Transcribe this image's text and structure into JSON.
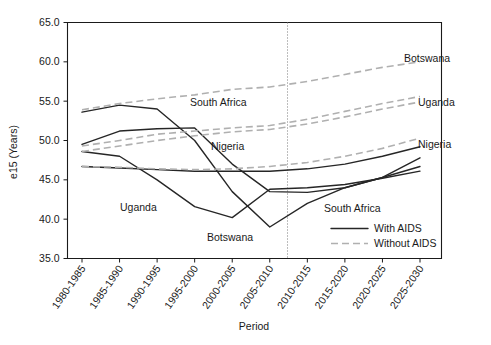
{
  "chart_data": {
    "type": "line",
    "title": "",
    "xlabel": "Period",
    "ylabel": "e15 (Years)",
    "ylim": [
      35.0,
      65.0
    ],
    "ytick_labels": [
      "35.0",
      "40.0",
      "45.0",
      "50.0",
      "55.0",
      "60.0",
      "65.0"
    ],
    "ytick_values": [
      35.0,
      40.0,
      45.0,
      50.0,
      55.0,
      60.0,
      65.0
    ],
    "grid": false,
    "legend_position": "inside-bottom-right",
    "categories": [
      "1980-1985",
      "1985-1990",
      "1990-1995",
      "1995-2000",
      "2000-2005",
      "2005-2010",
      "2010-2015",
      "2015-2020",
      "2020-2025",
      "2025-2030"
    ],
    "annotations": [
      {
        "text": "Botswana",
        "near": "without-aids-botswana-right"
      },
      {
        "text": "Uganda",
        "near": "without-aids-uganda-right"
      },
      {
        "text": "South Africa",
        "near": "without-aids-southafrica-mid"
      },
      {
        "text": "Nigeria",
        "near": "without-aids-nigeria-mid"
      },
      {
        "text": "Uganda",
        "near": "with-aids-uganda-dip"
      },
      {
        "text": "Botswana",
        "near": "with-aids-botswana-dip"
      },
      {
        "text": "Nigeria",
        "near": "with-aids-nigeria-right"
      },
      {
        "text": "South Africa",
        "near": "with-aids-southafrica-right"
      }
    ],
    "projection_divider": {
      "label": "",
      "at_category_boundary": "2005-2010 / 2010-2015"
    },
    "series": [
      {
        "name": "Botswana",
        "scenario": "With AIDS",
        "style": "solid",
        "values": [
          53.6,
          54.5,
          54.0,
          50.0,
          43.5,
          39.0,
          42.0,
          44.0,
          45.3,
          46.7
        ]
      },
      {
        "name": "South Africa",
        "scenario": "With AIDS",
        "style": "solid",
        "values": [
          49.5,
          51.2,
          51.5,
          51.6,
          47.0,
          43.5,
          43.4,
          44.0,
          45.3,
          47.8
        ]
      },
      {
        "name": "Uganda",
        "scenario": "With AIDS",
        "style": "solid",
        "values": [
          48.6,
          48.0,
          45.0,
          41.6,
          40.2,
          43.8,
          44.0,
          44.4,
          45.2,
          46.1
        ]
      },
      {
        "name": "Nigeria",
        "scenario": "With AIDS",
        "style": "solid",
        "values": [
          46.7,
          46.5,
          46.3,
          46.1,
          46.1,
          46.1,
          46.4,
          47.0,
          48.0,
          49.2
        ]
      },
      {
        "name": "Botswana",
        "scenario": "Without AIDS",
        "style": "dashed",
        "values": [
          53.9,
          54.7,
          55.3,
          55.8,
          56.5,
          56.8,
          57.5,
          58.4,
          59.3,
          60.0
        ]
      },
      {
        "name": "South Africa",
        "scenario": "Without AIDS",
        "style": "dashed",
        "values": [
          49.3,
          50.0,
          50.8,
          51.2,
          51.6,
          51.9,
          52.7,
          53.7,
          54.7,
          55.6
        ]
      },
      {
        "name": "Uganda",
        "scenario": "Without AIDS",
        "style": "dashed",
        "values": [
          48.6,
          49.3,
          50.0,
          50.6,
          51.1,
          51.4,
          52.1,
          53.0,
          54.0,
          54.9
        ]
      },
      {
        "name": "Nigeria",
        "scenario": "Without AIDS",
        "style": "dashed",
        "values": [
          46.7,
          46.6,
          46.4,
          46.3,
          46.4,
          46.7,
          47.2,
          48.0,
          49.0,
          50.3
        ]
      }
    ],
    "legend": [
      {
        "label": "With AIDS",
        "style": "solid",
        "color": "#262626"
      },
      {
        "label": "Without AIDS",
        "style": "dashed",
        "color": "#b0b0b0"
      }
    ],
    "colors": {
      "with_aids": "#262626",
      "without_aids": "#b0b0b0",
      "axis": "#1a1a1a",
      "background": "#ffffff"
    }
  }
}
